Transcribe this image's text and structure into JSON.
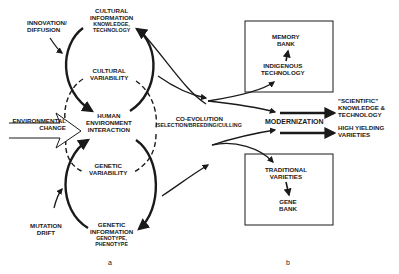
{
  "diagram": {
    "panel_a": {
      "label": "a",
      "cultural_information": {
        "title_line1": "CULTURAL",
        "title_line2": "INFORMATION",
        "sub_line1": "KNOWLEDGE,",
        "sub_line2": "TECHNOLOGY"
      },
      "cultural_variability": {
        "line1": "CULTURAL",
        "line2": "VARIABILITY"
      },
      "human_environment": {
        "line1": "HUMAN",
        "line2": "ENVIRONMENT",
        "line3": "INTERACTION"
      },
      "genetic_variability": {
        "line1": "GENETIC",
        "line2": "VARIABILITY"
      },
      "genetic_information": {
        "title_line1": "GENETIC",
        "title_line2": "INFORMATION",
        "sub_line1": "GENOTYPE,",
        "sub_line2": "PHENOTYPE"
      },
      "innovation": {
        "line1": "INNOVATION/",
        "line2": "DIFFUSION"
      },
      "mutation": {
        "line1": "MUTATION",
        "line2": "DRIFT"
      },
      "environmental_change": {
        "line1": "ENVIRONMENTAL",
        "line2": "CHANGE"
      }
    },
    "coevolution": {
      "line1": "CO-EVOLUTION",
      "line2": "SELECTION/BREEDING/CULLING"
    },
    "panel_b": {
      "label": "b",
      "memory_box": {
        "top_line1": "MEMORY",
        "top_line2": "BANK",
        "bottom_line1": "INDIGENOUS",
        "bottom_line2": "TECHNOLOGY"
      },
      "modernization": "MODERNIZATION",
      "scientific": {
        "line1": "\"SCIENTIFIC\"",
        "line2": "KNOWLEDGE &",
        "line3": "TECHNOLOGY"
      },
      "high_yielding": {
        "line1": "HIGH YIELDING",
        "line2": "VARIETIES"
      },
      "gene_box": {
        "top_line1": "TRADITIONAL",
        "top_line2": "VARIETIES",
        "bottom_line1": "GENE",
        "bottom_line2": "BANK"
      }
    },
    "colors": {
      "ink": "#1a1a1a",
      "background": "#ffffff"
    }
  }
}
